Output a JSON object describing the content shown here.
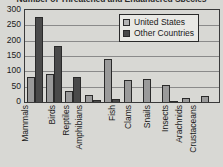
{
  "chart_data": {
    "type": "bar",
    "title": "Number of Threatened and Endangered Species",
    "xlabel": "",
    "ylabel": "",
    "ylim": [
      0,
      300
    ],
    "yticks": [
      300,
      250,
      200,
      150,
      100,
      50,
      0
    ],
    "grid": true,
    "legend_position": "top-right",
    "categories": [
      "Mammals",
      "Birds",
      "Reptiles",
      "Amphibians",
      "Fish",
      "Clams",
      "Snails",
      "Insects",
      "Arachnids",
      "Crustaceans"
    ],
    "series": [
      {
        "name": "United States",
        "color": "#9a9a9a",
        "values": [
          80,
          90,
          36,
          22,
          140,
          71,
          76,
          56,
          12,
          21
        ]
      },
      {
        "name": "Other Countries",
        "color": "#4a4a4a",
        "values": [
          277,
          182,
          80,
          8,
          11,
          2,
          1,
          4,
          0,
          0
        ]
      }
    ]
  },
  "legend": {
    "entries": [
      {
        "label": "United States",
        "swatch": "us"
      },
      {
        "label": "Other Countries",
        "swatch": "other"
      }
    ]
  }
}
